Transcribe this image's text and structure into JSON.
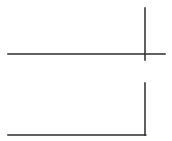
{
  "diagram": {
    "background": "#ffffff",
    "stroke_color": "#2b2b2b",
    "stroke_width": 1.5,
    "lines": [
      {
        "id": "top-horizontal",
        "x1": 8,
        "y1": 54,
        "x2": 165,
        "y2": 54
      },
      {
        "id": "top-vertical",
        "x1": 145,
        "y1": 8,
        "x2": 145,
        "y2": 60
      },
      {
        "id": "bottom-vertical",
        "x1": 145,
        "y1": 83,
        "x2": 145,
        "y2": 135
      },
      {
        "id": "bottom-horizontal",
        "x1": 8,
        "y1": 135,
        "x2": 145.75,
        "y2": 135
      }
    ]
  }
}
